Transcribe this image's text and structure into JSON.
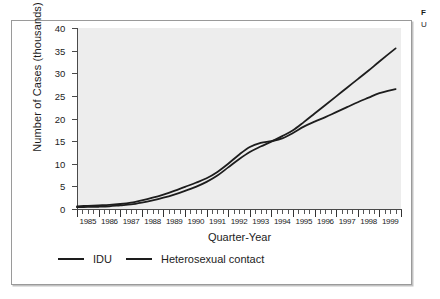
{
  "caption": {
    "title": "F",
    "line2": "U"
  },
  "chart_data": {
    "type": "line",
    "title": "",
    "subtitle": "",
    "xlabel": "Quarter-Year",
    "ylabel": "Number of Cases (thousands)",
    "xlim": [
      1985,
      2000
    ],
    "ylim": [
      0,
      40
    ],
    "grid": false,
    "legend_position": "bottom-left",
    "x_tick_labels": [
      "1985",
      "1986",
      "1987",
      "1988",
      "1989",
      "1990",
      "1991",
      "1992",
      "1993",
      "1994",
      "1995",
      "1996",
      "1997",
      "1998",
      "1999"
    ],
    "y_tick_labels": [
      "0",
      "5",
      "10",
      "15",
      "20",
      "25",
      "30",
      "35",
      "40"
    ],
    "y_ticks": [
      0,
      5,
      10,
      15,
      20,
      25,
      30,
      35,
      40
    ],
    "minor_ticks_per_year": 4,
    "x": [
      1985,
      1985.5,
      1986,
      1986.5,
      1987,
      1987.5,
      1988,
      1988.5,
      1989,
      1989.5,
      1990,
      1990.5,
      1991,
      1991.5,
      1992,
      1992.5,
      1993,
      1993.5,
      1994,
      1994.5,
      1995,
      1995.5,
      1996,
      1996.5,
      1997,
      1997.5,
      1998,
      1998.5,
      1999,
      1999.75
    ],
    "series": [
      {
        "name": "IDU",
        "color": "#1d1d1d",
        "values": [
          0.6,
          0.7,
          0.8,
          0.9,
          1.1,
          1.4,
          1.9,
          2.5,
          3.2,
          4.0,
          4.9,
          5.8,
          6.8,
          8.2,
          10.0,
          12.0,
          13.7,
          14.6,
          15.0,
          15.6,
          16.8,
          18.2,
          19.3,
          20.3,
          21.4,
          22.5,
          23.6,
          24.6,
          25.6,
          26.5
        ]
      },
      {
        "name": "Heterosexual contact",
        "color": "#1d1d1d",
        "values": [
          0.4,
          0.45,
          0.5,
          0.6,
          0.8,
          1.0,
          1.4,
          1.9,
          2.5,
          3.2,
          4.0,
          4.9,
          6.0,
          7.4,
          9.2,
          11.0,
          12.6,
          13.8,
          14.9,
          16.1,
          17.4,
          19.2,
          21.1,
          23.0,
          24.9,
          26.8,
          28.7,
          30.6,
          32.6,
          35.5
        ]
      }
    ]
  }
}
